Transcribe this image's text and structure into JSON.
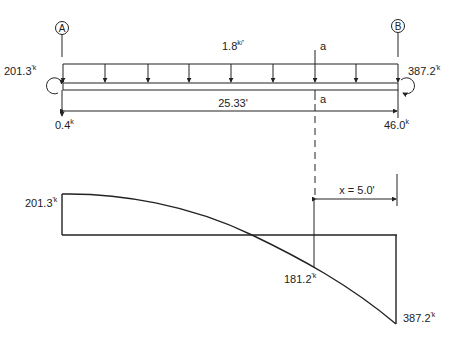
{
  "beam": {
    "support_left": "A",
    "support_right": "B",
    "distributed_load": {
      "value": "1.8",
      "unit": "k/'"
    },
    "span": "25.33'",
    "section_label": "a",
    "left_end_moment": {
      "value": "201.3",
      "unit": "'k"
    },
    "right_end_moment": {
      "value": "387.2",
      "unit": "'k"
    },
    "left_reaction": {
      "value": "0.4",
      "unit": "k"
    },
    "right_reaction": {
      "value": "46.0",
      "unit": "k"
    }
  },
  "moment_diagram": {
    "left_value": {
      "value": "201.3",
      "unit": "'k"
    },
    "section_value": {
      "value": "181.2",
      "unit": "'k"
    },
    "right_value": {
      "value": "387.2",
      "unit": "'k"
    },
    "dimension": "x = 5.0'"
  },
  "colors": {
    "line": "#222222",
    "background": "#ffffff"
  }
}
